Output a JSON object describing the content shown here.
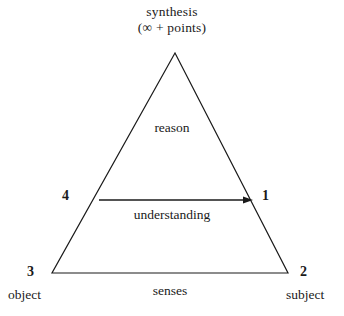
{
  "diagram": {
    "title_lines": {
      "line1": "synthesis",
      "infinity": "∞",
      "plus": "+",
      "points": "points)",
      "open_paren": "(",
      "line2": "(∞  +  points)"
    },
    "regions": {
      "upper": "reason",
      "middle": "understanding",
      "base": "senses"
    },
    "vertices": {
      "apex_number": "",
      "left_mid_number": "4",
      "right_mid_number": "1",
      "bottom_left_number": "3",
      "bottom_right_number": "2"
    },
    "corner_labels": {
      "bottom_left": "object",
      "bottom_right": "subject"
    },
    "colors": {
      "stroke": "#1a1a1a",
      "background": "#ffffff",
      "text": "#1a1a1a"
    },
    "geometry": {
      "apex": [
        175,
        53
      ],
      "bottom_left": [
        52,
        273
      ],
      "bottom_right": [
        288,
        273
      ],
      "arrow_start": [
        99,
        200
      ],
      "arrow_end": [
        252,
        200
      ]
    }
  }
}
